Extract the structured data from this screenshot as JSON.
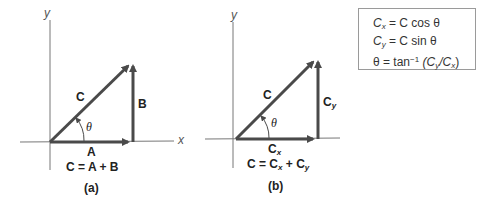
{
  "colors": {
    "axis": "#777777",
    "vector": "#4a4a4a",
    "text": "#222222",
    "box_border": "#9a9a9a"
  },
  "panel_a": {
    "caption": "(a)",
    "axis_x": "x",
    "axis_y": "y",
    "vector_resultant": "C",
    "vector_horizontal": "A",
    "vector_vertical": "B",
    "angle": "θ",
    "equation": "C = A + B"
  },
  "panel_b": {
    "caption": "(b)",
    "axis_x": "x",
    "axis_y": "y",
    "vector_resultant": "C",
    "vector_horizontal": "C",
    "vector_horizontal_sub": "x",
    "vector_vertical": "C",
    "vector_vertical_sub": "y",
    "angle": "θ",
    "equation_lhs": "C = C",
    "equation_sub1": "x",
    "equation_plus": " + C",
    "equation_sub2": "y"
  },
  "formula_box": {
    "line1": {
      "lhs": "C",
      "lhs_sub": "x",
      "rhs": " = C cos θ"
    },
    "line2": {
      "lhs": "C",
      "lhs_sub": "y",
      "rhs": " = C sin θ"
    },
    "line3": {
      "lhs": "θ = tan",
      "sup": "−1",
      "mid": " (C",
      "sub1": "y",
      "slash": "/C",
      "sub2": "x",
      "end": ")"
    }
  }
}
